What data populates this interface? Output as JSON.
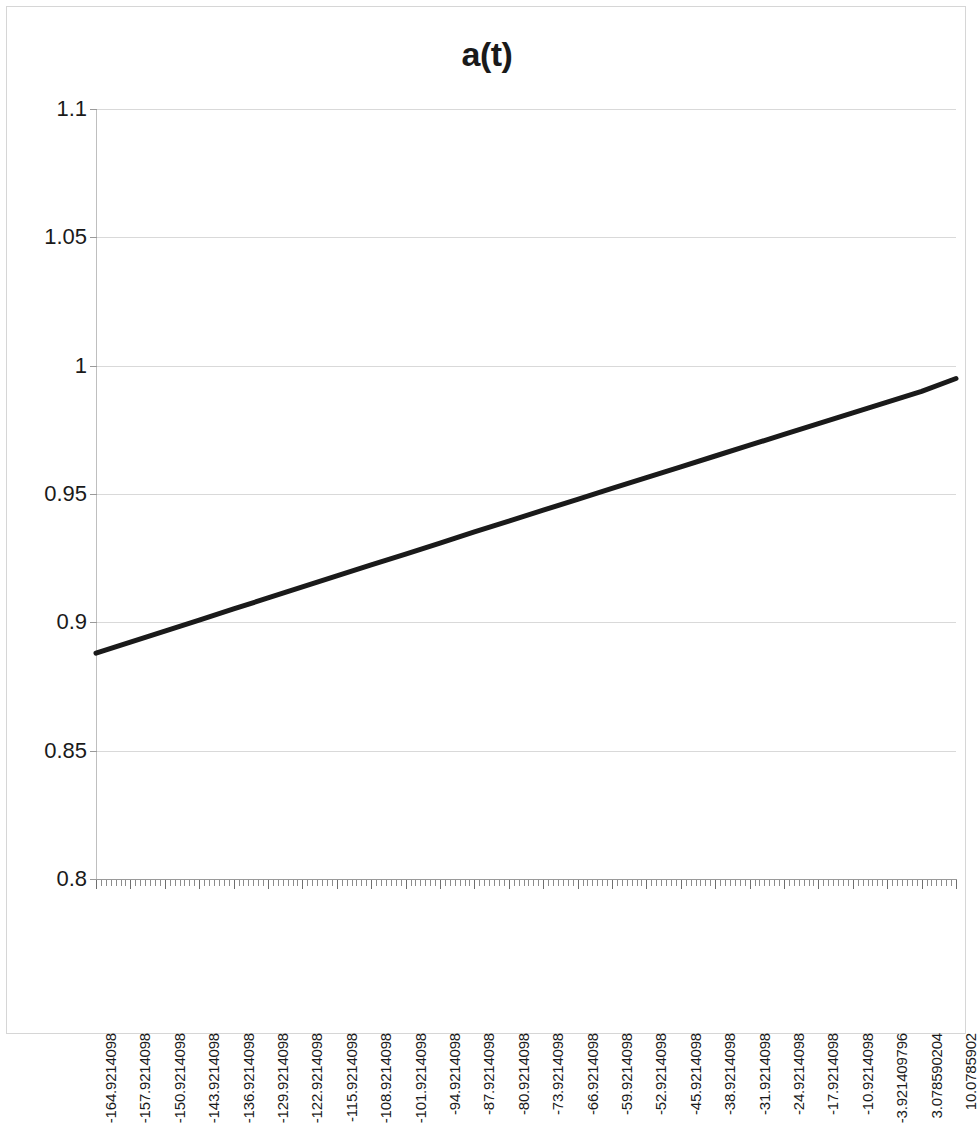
{
  "chart_data": {
    "type": "line",
    "title": "a(t)",
    "xlabel": "",
    "ylabel": "",
    "grid": true,
    "legend": false,
    "ylim": [
      0.8,
      1.1
    ],
    "ytick_step": 0.05,
    "yticks": [
      "0.8",
      "0.85",
      "0.9",
      "0.95",
      "1",
      "1.05",
      "1.1"
    ],
    "ytick_values": [
      0.8,
      0.85,
      0.9,
      0.95,
      1.0,
      1.05,
      1.1
    ],
    "xlim": [
      -164.9214098,
      10.0785902
    ],
    "xtick_step": 7,
    "xticks": [
      "-164.9214098",
      "-157.9214098",
      "-150.9214098",
      "-143.9214098",
      "-136.9214098",
      "-129.9214098",
      "-122.9214098",
      "-115.9214098",
      "-108.9214098",
      "-101.9214098",
      "-94.9214098",
      "-87.9214098",
      "-80.9214098",
      "-73.9214098",
      "-66.9214098",
      "-59.9214098",
      "-52.9214098",
      "-45.9214098",
      "-38.9214098",
      "-31.9214098",
      "-24.9214098",
      "-17.9214098",
      "-10.9214098",
      "-3.921409796",
      "3.078590204",
      "10.0785902"
    ],
    "series": [
      {
        "name": "a(t)",
        "color": "#1a1a1a",
        "line_width": 5,
        "x": [
          -164.9214098,
          -157.9214098,
          -150.9214098,
          -143.9214098,
          -136.9214098,
          -129.9214098,
          -122.9214098,
          -115.9214098,
          -108.9214098,
          -101.9214098,
          -94.9214098,
          -87.9214098,
          -80.9214098,
          -73.9214098,
          -66.9214098,
          -59.9214098,
          -52.9214098,
          -45.9214098,
          -38.9214098,
          -31.9214098,
          -24.9214098,
          -17.9214098,
          -10.9214098,
          -3.921409796,
          3.078590204,
          10.0785902
        ],
        "values": [
          0.888,
          0.8923,
          0.8966,
          0.9009,
          0.9052,
          0.9095,
          0.9138,
          0.9181,
          0.9224,
          0.9266,
          0.9309,
          0.9352,
          0.9394,
          0.9437,
          0.9479,
          0.9522,
          0.9564,
          0.9606,
          0.9648,
          0.969,
          0.9732,
          0.9774,
          0.9816,
          0.9858,
          0.99,
          0.995
        ]
      }
    ],
    "colors": {
      "line": "#1a1a1a",
      "gridline": "#d9d9d9",
      "axis": "#9a9a9a",
      "frame": "#d6d6d6",
      "text": "#1a1a1a"
    }
  }
}
